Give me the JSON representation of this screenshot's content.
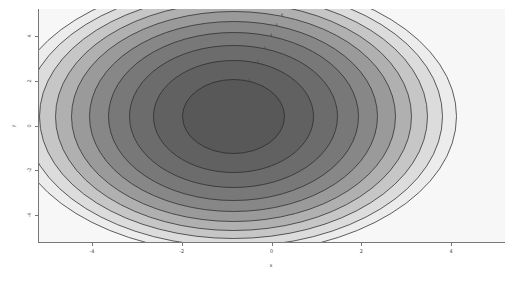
{
  "chart_data": {
    "type": "heatmap",
    "subtype": "filled-contour",
    "title": "",
    "xlabel": "x",
    "ylabel": "y",
    "xlim": [
      -5.2,
      5.2
    ],
    "ylim": [
      -5.2,
      5.2
    ],
    "xticks": [
      -4,
      -2,
      0,
      2,
      4
    ],
    "xticklabels": [
      "-4",
      "-2",
      "0",
      "2",
      "4"
    ],
    "yticks": [
      4,
      2,
      0,
      -2,
      -4
    ],
    "yticklabels": [
      "4",
      "2",
      "0",
      "-2",
      "-4"
    ],
    "grid": false,
    "legend": false,
    "colormap": "gray",
    "colormap_direction": "low-values-dark-center-to-high-values-light-edges",
    "function": "elliptic paraboloid: z = (x/2.0)^2 + (y/1.0)^2 (anisotropic quadratic bowl)",
    "contour_levels": [
      1,
      2,
      3,
      4,
      5,
      6,
      7,
      8,
      9,
      10
    ],
    "contour_level_labels": [
      "1",
      "2",
      "3",
      "4",
      "5",
      "6",
      "7",
      "8",
      "9",
      "10"
    ],
    "contour_line_color": "#2b2b2b",
    "fill_bands": [
      {
        "level_range": [
          0,
          1
        ],
        "color": "#585858"
      },
      {
        "level_range": [
          1,
          2
        ],
        "color": "#616161"
      },
      {
        "level_range": [
          2,
          3
        ],
        "color": "#6c6c6c"
      },
      {
        "level_range": [
          3,
          4
        ],
        "color": "#787878"
      },
      {
        "level_range": [
          4,
          5
        ],
        "color": "#878787"
      },
      {
        "level_range": [
          5,
          6
        ],
        "color": "#9a9a9a"
      },
      {
        "level_range": [
          6,
          7
        ],
        "color": "#b0b0b0"
      },
      {
        "level_range": [
          7,
          8
        ],
        "color": "#c6c6c6"
      },
      {
        "level_range": [
          8,
          9
        ],
        "color": "#dcdcdc"
      },
      {
        "level_range": [
          9,
          10
        ],
        "color": "#ececec"
      },
      {
        "level_range": [
          10,
          999
        ],
        "color": "#f7f7f7"
      }
    ],
    "ellipse_semi_axes_px": [
      {
        "level": 1,
        "rx": 51,
        "ry": 37
      },
      {
        "level": 2,
        "rx": 80,
        "ry": 56
      },
      {
        "level": 3,
        "rx": 104,
        "ry": 71
      },
      {
        "level": 4,
        "rx": 125,
        "ry": 84
      },
      {
        "level": 5,
        "rx": 144,
        "ry": 95
      },
      {
        "level": 6,
        "rx": 162,
        "ry": 105
      },
      {
        "level": 7,
        "rx": 178,
        "ry": 114
      },
      {
        "level": 8,
        "rx": 194,
        "ry": 122
      },
      {
        "level": 9,
        "rx": 209,
        "ry": 130
      },
      {
        "level": 10,
        "rx": 223,
        "ry": 137
      }
    ],
    "axis_color": "#777777",
    "background_color": "#ffffff",
    "plot_area_px": {
      "left": 38,
      "top": 9,
      "width": 467,
      "height": 233
    },
    "center_px": {
      "x": 233.5,
      "y": 116.5
    },
    "px_per_unit": {
      "x": 44.9,
      "y": 22.4
    }
  },
  "figure": {
    "canvas_label": "matplotlib-figure-canvas",
    "background_color": "#ffffff"
  }
}
